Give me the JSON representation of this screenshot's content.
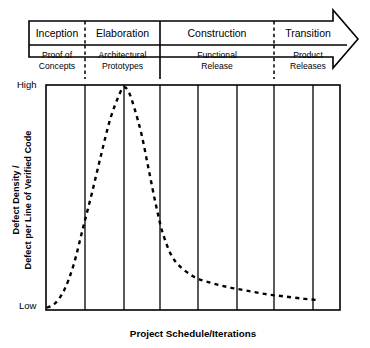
{
  "figure": {
    "title_hidden": "",
    "phases": [
      {
        "name": "Inception",
        "sublabel_line1": "Proof of",
        "sublabel_line2": "Concepts",
        "divider_after": "dashed"
      },
      {
        "name": "Elaboration",
        "sublabel_line1": "Architectural",
        "sublabel_line2": "Prototypes",
        "divider_after": "solid"
      },
      {
        "name": "Construction",
        "sublabel_line1": "Functional",
        "sublabel_line2": "Release",
        "divider_after": "dashed"
      },
      {
        "name": "Transition",
        "sublabel_line1": "Product",
        "sublabel_line2": "Releases",
        "divider_after": "none"
      }
    ],
    "y_axis": {
      "title_line1": "Defect Density /",
      "title_line2": "Defect per Line of Verified Code",
      "tick_high": "High",
      "tick_low": "Low"
    },
    "x_axis": {
      "title": "Project Schedule/Iterations"
    },
    "colors": {
      "stroke": "#000000",
      "background": "#ffffff",
      "curve": "#000000"
    }
  },
  "chart_data": {
    "type": "line",
    "title": "",
    "xlabel": "Project Schedule/Iterations",
    "ylabel": "Defect Density / Defect per Line of Verified Code",
    "xlim": [
      0,
      8
    ],
    "ylim": [
      0,
      1
    ],
    "ytick_labels": [
      "Low",
      "High"
    ],
    "ytick_values": [
      0,
      1
    ],
    "grid": "vertical-only",
    "legend": "none",
    "line_style": "dashed",
    "categories": [
      "Inception",
      "Elaboration",
      "Construction",
      "Transition"
    ],
    "series": [
      {
        "name": "Defect density over iterations",
        "x": [
          0.02,
          0.25,
          0.5,
          0.75,
          1.0,
          1.25,
          1.5,
          1.75,
          2.0,
          2.12,
          2.25,
          2.4,
          2.6,
          2.8,
          3.0,
          3.2,
          3.5,
          4.0,
          4.5,
          5.0,
          5.5,
          6.0,
          6.5,
          7.0,
          7.35
        ],
        "y": [
          0.01,
          0.03,
          0.09,
          0.2,
          0.36,
          0.52,
          0.69,
          0.85,
          0.96,
          0.99,
          0.97,
          0.9,
          0.78,
          0.62,
          0.46,
          0.33,
          0.22,
          0.15,
          0.12,
          0.1,
          0.085,
          0.07,
          0.06,
          0.05,
          0.045
        ]
      }
    ],
    "gridline_x_values": [
      1,
      2,
      3,
      4,
      5,
      6,
      7
    ]
  }
}
